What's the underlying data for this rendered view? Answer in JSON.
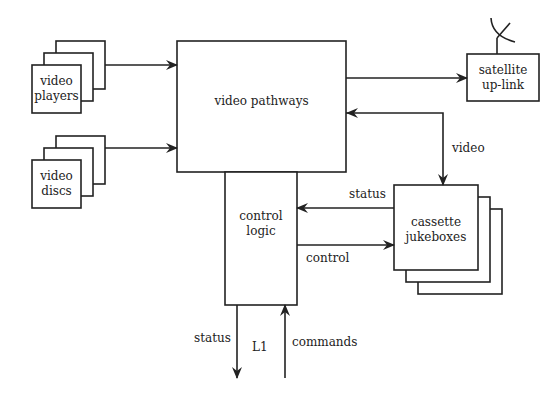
{
  "diagram": {
    "nodes": {
      "video_players": {
        "line1": "video",
        "line2": "players"
      },
      "video_discs": {
        "line1": "video",
        "line2": "discs"
      },
      "video_pathways": {
        "label": "video pathways"
      },
      "satellite_uplink": {
        "line1": "satellite",
        "line2": "up-link"
      },
      "control_logic": {
        "line1": "control",
        "line2": "logic"
      },
      "cassette_jukeboxes": {
        "line1": "cassette",
        "line2": "jukeboxes"
      }
    },
    "edges": {
      "video": "video",
      "status_jukebox": "status",
      "control": "control",
      "status_out": "status",
      "link": "L1",
      "commands": "commands"
    },
    "colors": {
      "line": "#222222",
      "background": "#ffffff"
    }
  }
}
